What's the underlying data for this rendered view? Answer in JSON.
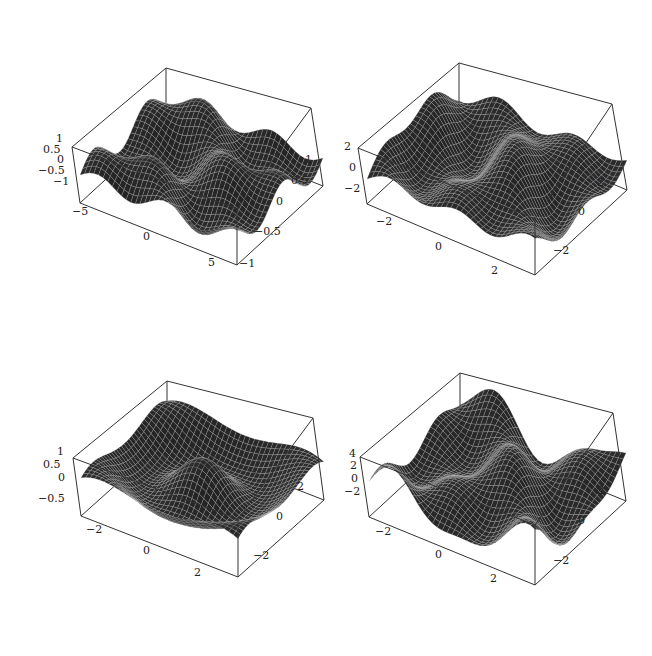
{
  "page": {
    "background": "#ffffff",
    "mesh_fill": "#3a3a3a",
    "mesh_line": "#d0d0d0",
    "box_color": "#333333"
  },
  "chart_data": [
    {
      "type": "surface3d",
      "title": "",
      "panel": "top-left",
      "xlim": [
        -6.5,
        6.5
      ],
      "ylim": [
        -1,
        1
      ],
      "zlim": [
        -1,
        1
      ],
      "x_ticks": [
        "-5",
        "0",
        "5"
      ],
      "y_ticks": [
        "1",
        "0.5",
        "0",
        "-0.5",
        "-1"
      ],
      "z_ticks": [
        "1",
        "0.5",
        "0",
        "-0.5",
        "-1"
      ],
      "description": "Wavy surface with tall central peak, second ridge at right, trough at front-left",
      "box": {
        "top_back": [
          166,
          68
        ],
        "top_left": [
          72,
          147
        ],
        "top_right": [
          311,
          108
        ],
        "bottom_left": [
          80,
          203
        ],
        "bottom_front": [
          237,
          265
        ],
        "bottom_right": [
          311,
          190
        ]
      },
      "fx": 0.9,
      "fy": 3.0,
      "phase": 0.0
    },
    {
      "type": "surface3d",
      "title": "",
      "panel": "top-right",
      "xlim": [
        -3,
        3
      ],
      "ylim": [
        -3,
        3
      ],
      "zlim": [
        -3,
        3
      ],
      "x_ticks": [
        "-2",
        "0",
        "2"
      ],
      "y_ticks": [
        "2",
        "0",
        "-2"
      ],
      "z_ticks": [
        "2",
        "0",
        "-2"
      ],
      "description": "Rippled surface with several parallel ridges along the back-left",
      "box": {
        "top_back": [
          459,
          63
        ],
        "top_left": [
          358,
          148
        ],
        "top_right": [
          612,
          104
        ],
        "bottom_left": [
          367,
          204
        ],
        "bottom_front": [
          535,
          275
        ],
        "bottom_right": [
          612,
          190
        ]
      },
      "fx": 1.6,
      "fy": 1.1,
      "phase": 0.7
    },
    {
      "type": "surface3d",
      "title": "",
      "panel": "bottom-left",
      "xlim": [
        -3,
        3
      ],
      "ylim": [
        -3,
        3
      ],
      "zlim": [
        -0.8,
        1
      ],
      "x_ticks": [
        "-2",
        "0",
        "2"
      ],
      "y_ticks": [
        "2",
        "0",
        "-2"
      ],
      "z_ticks": [
        "1",
        "0.5",
        "0",
        "-0.5"
      ],
      "description": "Radially symmetric rippled surface with central peak and concentric ring",
      "box": {
        "top_back": [
          167,
          381
        ],
        "top_left": [
          73,
          458
        ],
        "top_right": [
          313,
          418
        ],
        "bottom_left": [
          81,
          516
        ],
        "bottom_front": [
          238,
          577
        ],
        "bottom_right": [
          313,
          500
        ]
      },
      "fx": 1.0,
      "fy": 1.0,
      "phase": 0.0,
      "radial": true
    },
    {
      "type": "surface3d",
      "title": "",
      "panel": "bottom-right",
      "xlim": [
        -3,
        3
      ],
      "ylim": [
        -3,
        3
      ],
      "zlim": [
        -3,
        4.5
      ],
      "x_ticks": [
        "-2",
        "0",
        "2"
      ],
      "y_ticks": [
        "2",
        "0",
        "-2"
      ],
      "z_ticks": [
        "4",
        "2",
        "0",
        "-2"
      ],
      "description": "Irregular surface with sharp spikes at left and right corners",
      "box": {
        "top_back": [
          460,
          373
        ],
        "top_left": [
          360,
          457
        ],
        "top_right": [
          613,
          413
        ],
        "bottom_left": [
          369,
          517
        ],
        "bottom_front": [
          535,
          585
        ],
        "bottom_right": [
          613,
          500
        ]
      },
      "fx": 1.3,
      "fy": 1.8,
      "phase": 1.2
    }
  ],
  "labels": {
    "p1": {
      "z": [
        {
          "t": "1",
          "x": 56,
          "y": 139
        },
        {
          "t": "0.5",
          "x": 43,
          "y": 150
        },
        {
          "t": "0",
          "x": 57,
          "y": 160
        },
        {
          "t": "-0.5",
          "x": 38,
          "y": 171
        },
        {
          "t": "-1",
          "x": 53,
          "y": 182
        }
      ],
      "x": [
        {
          "t": "-5",
          "x": 72,
          "y": 212
        },
        {
          "t": "0",
          "x": 143,
          "y": 237
        },
        {
          "t": "5",
          "x": 208,
          "y": 263
        }
      ],
      "y": [
        {
          "t": "1",
          "x": 305,
          "y": 160
        },
        {
          "t": "0.5",
          "x": 291,
          "y": 181
        },
        {
          "t": "0",
          "x": 276,
          "y": 202
        },
        {
          "t": "-0.5",
          "x": 254,
          "y": 232
        },
        {
          "t": "-1",
          "x": 239,
          "y": 264
        }
      ]
    },
    "p2": {
      "z": [
        {
          "t": "2",
          "x": 344,
          "y": 147
        },
        {
          "t": "0",
          "x": 349,
          "y": 168
        },
        {
          "t": "-2",
          "x": 344,
          "y": 189
        }
      ],
      "x": [
        {
          "t": "-2",
          "x": 376,
          "y": 222
        },
        {
          "t": "0",
          "x": 435,
          "y": 247
        },
        {
          "t": "2",
          "x": 491,
          "y": 271
        }
      ],
      "y": [
        {
          "t": "2",
          "x": 597,
          "y": 183
        },
        {
          "t": "0",
          "x": 578,
          "y": 212
        },
        {
          "t": "-2",
          "x": 553,
          "y": 251
        }
      ]
    },
    "p3": {
      "z": [
        {
          "t": "1",
          "x": 57,
          "y": 452
        },
        {
          "t": "0.5",
          "x": 43,
          "y": 465
        },
        {
          "t": "0",
          "x": 58,
          "y": 478
        },
        {
          "t": "-0.5",
          "x": 38,
          "y": 499
        }
      ],
      "x": [
        {
          "t": "-2",
          "x": 86,
          "y": 530
        },
        {
          "t": "0",
          "x": 143,
          "y": 551
        },
        {
          "t": "2",
          "x": 194,
          "y": 573
        }
      ],
      "y": [
        {
          "t": "2",
          "x": 297,
          "y": 487
        },
        {
          "t": "0",
          "x": 276,
          "y": 517
        },
        {
          "t": "-2",
          "x": 253,
          "y": 556
        }
      ]
    },
    "p4": {
      "z": [
        {
          "t": "4",
          "x": 349,
          "y": 454
        },
        {
          "t": "2",
          "x": 350,
          "y": 466
        },
        {
          "t": "0",
          "x": 351,
          "y": 479
        },
        {
          "t": "-2",
          "x": 344,
          "y": 492
        }
      ],
      "x": [
        {
          "t": "-2",
          "x": 375,
          "y": 532
        },
        {
          "t": "0",
          "x": 435,
          "y": 555
        },
        {
          "t": "2",
          "x": 490,
          "y": 579
        }
      ],
      "y": [
        {
          "t": "2",
          "x": 597,
          "y": 491
        },
        {
          "t": "0",
          "x": 578,
          "y": 521
        },
        {
          "t": "-2",
          "x": 553,
          "y": 561
        }
      ]
    }
  }
}
